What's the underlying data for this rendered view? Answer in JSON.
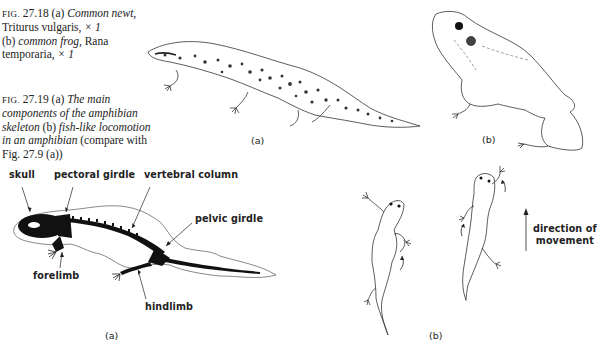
{
  "captions": {
    "fig_27_18": {
      "fig_prefix": "FIG.",
      "number": "27.18",
      "part_a_marker": "(a)",
      "part_a_common": "Common newt,",
      "part_a_latin": "Triturus vulgaris,",
      "part_a_scale": "× 1",
      "part_b_marker": "(b)",
      "part_b_common": "common frog,",
      "part_b_latin_1": "Rana",
      "part_b_latin_2": "temporaria,",
      "part_b_scale": "× 1"
    },
    "fig_27_19": {
      "fig_prefix": "FIG.",
      "number": "27.19",
      "part_a_marker": "(a)",
      "part_a_text_1": "The main",
      "part_a_text_2": "components of the amphibian",
      "part_a_text_3": "skeleton",
      "part_b_marker": "(b)",
      "part_b_text_1": "fish-like locomotion",
      "part_b_text_2": "in an amphibian",
      "compare_text_1": "(compare with",
      "compare_text_2": "Fig. 27.9 (a))"
    }
  },
  "figure_27_18": {
    "newt_sublabel": "(a)",
    "frog_sublabel": "(b)"
  },
  "figure_27_19": {
    "skeleton_labels": {
      "skull": "skull",
      "pectoral_girdle": "pectoral girdle",
      "vertebral_column": "vertebral column",
      "pelvic_girdle": "pelvic girdle",
      "forelimb": "forelimb",
      "hindlimb": "hindlimb"
    },
    "skeleton_sublabel": "(a)",
    "locomotion_sublabel": "(b)",
    "direction_label_1": "direction of",
    "direction_label_2": "movement"
  }
}
